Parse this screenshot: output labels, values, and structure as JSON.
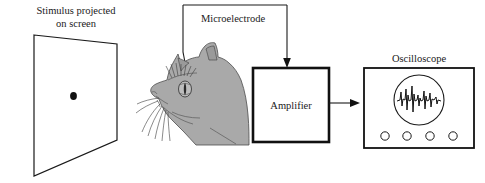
{
  "figure": {
    "background_color": "#ffffff",
    "ink_color": "#1a1a1a",
    "animal_color": "#a9a9a9"
  },
  "labels": {
    "stimulus_line1": "Stimulus projected",
    "stimulus_line2": "on screen",
    "microelectrode": "Microelectrode",
    "amplifier": "Amplifier",
    "oscilloscope": "Oscilloscope"
  },
  "components": {
    "screen": {
      "name": "projection-screen",
      "stimulus_dot": "small black dot"
    },
    "subject": {
      "name": "cat-head",
      "features": [
        "ears",
        "eye-with-slit-pupil",
        "whiskers",
        "muzzle",
        "electrode-insertion"
      ]
    },
    "amplifier_box": {
      "name": "amplifier",
      "input": "microelectrode signal",
      "output": "amplified signal"
    },
    "oscilloscope_unit": {
      "name": "oscilloscope",
      "display": "circular crt screen",
      "trace": "neural spike train",
      "knob_count": 4
    }
  },
  "connections": [
    {
      "from": "microelectrode-label",
      "to": "cat-head",
      "style": "plain-line"
    },
    {
      "from": "microelectrode-label",
      "to": "amplifier",
      "style": "arrow"
    },
    {
      "from": "amplifier",
      "to": "oscilloscope",
      "style": "arrow"
    }
  ]
}
